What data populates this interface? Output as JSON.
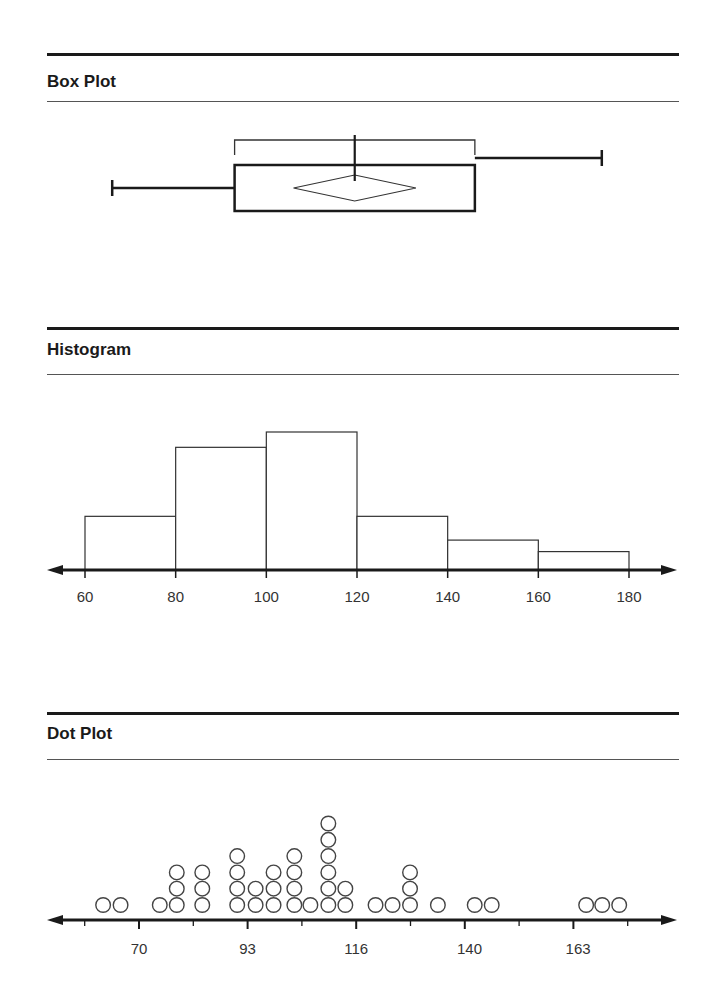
{
  "sections": {
    "box": {
      "title": "Box Plot"
    },
    "hist": {
      "title": "Histogram"
    },
    "dot": {
      "title": "Dot Plot"
    }
  },
  "colors": {
    "ink": "#1a1a1a",
    "line": "#333333",
    "fill": "#ffffff"
  },
  "chart_data": [
    {
      "type": "box",
      "title": "Box Plot",
      "scale_note": "no axis shown; values estimated using histogram scale (60–180)",
      "min": 66,
      "q1": 93,
      "median": 119.5,
      "q3": 146,
      "max": 174,
      "mean": 119.5,
      "mean_diamond_range": [
        106,
        133
      ],
      "iqr_bracket": true,
      "grid": false
    },
    {
      "type": "bar",
      "title": "Histogram",
      "categories": [
        "60-80",
        "80-100",
        "100-120",
        "120-140",
        "140-160",
        "160-180"
      ],
      "bin_edges": [
        60,
        80,
        100,
        120,
        140,
        160,
        180
      ],
      "values": [
        7,
        16,
        18,
        7,
        3.9,
        2.4
      ],
      "value_note": "relative heights (no y-axis shown)",
      "xlabel": "",
      "ylabel": "",
      "xticks": [
        60,
        80,
        100,
        120,
        140,
        160,
        180
      ],
      "xlim": [
        56,
        188
      ],
      "grid": false
    },
    {
      "type": "scatter",
      "subtype": "dot_plot",
      "title": "Dot Plot",
      "xticks_labeled": [
        70,
        93,
        116,
        140,
        163
      ],
      "tick_step": 11.5,
      "tick_count": 11,
      "xlim": [
        52,
        188
      ],
      "columns": [
        {
          "x": 62.4,
          "count": 1
        },
        {
          "x": 66.1,
          "count": 1
        },
        {
          "x": 74.4,
          "count": 1
        },
        {
          "x": 78.0,
          "count": 3
        },
        {
          "x": 83.4,
          "count": 3
        },
        {
          "x": 90.8,
          "count": 4
        },
        {
          "x": 94.7,
          "count": 2
        },
        {
          "x": 98.5,
          "count": 3
        },
        {
          "x": 102.9,
          "count": 4
        },
        {
          "x": 106.3,
          "count": 1
        },
        {
          "x": 110.1,
          "count": 6
        },
        {
          "x": 113.7,
          "count": 2
        },
        {
          "x": 120.1,
          "count": 1
        },
        {
          "x": 123.7,
          "count": 1
        },
        {
          "x": 127.4,
          "count": 3
        },
        {
          "x": 133.3,
          "count": 1
        },
        {
          "x": 141.1,
          "count": 1
        },
        {
          "x": 144.7,
          "count": 1
        },
        {
          "x": 164.7,
          "count": 1
        },
        {
          "x": 168.1,
          "count": 1
        },
        {
          "x": 171.7,
          "count": 1
        }
      ],
      "total_points": 42,
      "grid": false
    }
  ]
}
